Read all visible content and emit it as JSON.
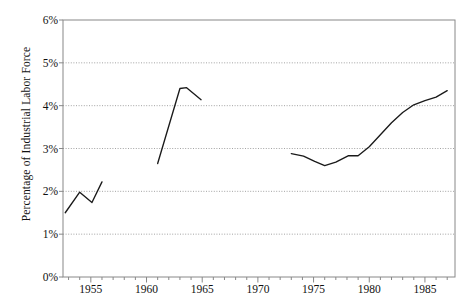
{
  "chart_data": {
    "type": "line",
    "title": "",
    "xlabel": "",
    "ylabel": "Percentage of Industrial Labor Force",
    "xlim": [
      1952.5,
      1987.7
    ],
    "ylim": [
      0,
      6
    ],
    "grid": true,
    "legend": false,
    "y_tick_labels": [
      "0%",
      "1%",
      "2%",
      "3%",
      "4%",
      "5%",
      "6%"
    ],
    "y_tick_values": [
      0,
      1,
      2,
      3,
      4,
      5,
      6
    ],
    "x_tick_labels": [
      "1955",
      "1960",
      "1965",
      "1970",
      "1975",
      "1980",
      "1985"
    ],
    "x_tick_values": [
      1955,
      1960,
      1965,
      1970,
      1975,
      1980,
      1985
    ],
    "x_minor_tick_step": 1,
    "line_color": "#1a1a1a",
    "grid_color": "#999999",
    "axis_color": "#888888",
    "series": [
      {
        "name": "segment-1",
        "x": [
          1952.7,
          1954.0,
          1955.1,
          1956.0
        ],
        "values": [
          1.5,
          1.98,
          1.74,
          2.22
        ]
      },
      {
        "name": "segment-2",
        "x": [
          1961.0,
          1963.0,
          1963.6,
          1964.9
        ],
        "values": [
          2.65,
          4.4,
          4.42,
          4.14
        ]
      },
      {
        "name": "segment-3",
        "x": [
          1973.0,
          1974.1,
          1975.1,
          1976.0,
          1977.0,
          1978.1,
          1979.0,
          1980.0,
          1981.0,
          1982.0,
          1983.0,
          1984.0,
          1985.0,
          1986.0,
          1987.0
        ],
        "values": [
          2.88,
          2.82,
          2.7,
          2.6,
          2.68,
          2.83,
          2.83,
          3.04,
          3.32,
          3.6,
          3.84,
          4.02,
          4.12,
          4.2,
          4.35
        ]
      }
    ]
  }
}
